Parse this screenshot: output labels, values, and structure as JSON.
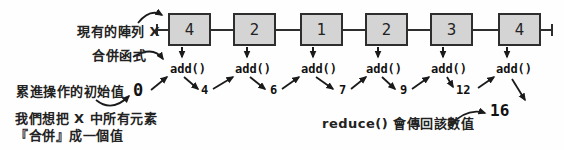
{
  "diagram": {
    "annotations": {
      "array_label": "現有的陣列 X",
      "combine_fn_label": "合併函式",
      "initial_value_label": "累進操作的初始值",
      "goal_line1": "我們想把 X 中所有元素",
      "goal_line2": "『合併』成一個值",
      "reduce_return_label": "reduce() 會傳回該數值"
    },
    "array_values": [
      "4",
      "2",
      "1",
      "2",
      "3",
      "4"
    ],
    "fn_calls": [
      "add()",
      "add()",
      "add()",
      "add()",
      "add()",
      "add()"
    ],
    "accumulator_values": [
      "0",
      "4",
      "6",
      "7",
      "9",
      "12"
    ],
    "result_value": "16",
    "colors": {
      "box_fill": "#d4d4d4",
      "box_border": "#2e2e2e",
      "arrow": "#1a1a1a",
      "background": "#fefefe"
    }
  }
}
